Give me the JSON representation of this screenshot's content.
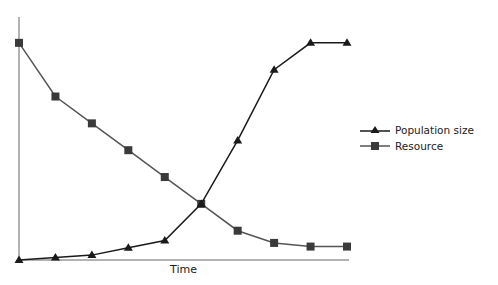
{
  "chart_data": {
    "type": "line",
    "title": "",
    "xlabel": "Time",
    "ylabel": "",
    "x": [
      0,
      1,
      2,
      3,
      4,
      5,
      6,
      7,
      8,
      9
    ],
    "series": [
      {
        "name": "Population size",
        "marker": "triangle",
        "values": [
          0,
          1,
          2,
          5,
          8,
          23,
          49,
          78,
          89,
          89
        ]
      },
      {
        "name": "Resource",
        "marker": "square",
        "values": [
          89,
          67,
          56,
          45,
          34,
          23,
          12,
          7,
          5.5,
          5.5
        ]
      }
    ],
    "ylim": [
      0,
      100
    ],
    "grid": false,
    "legend_position": "right",
    "colors": {
      "population": "#1a1a1a",
      "resource": "#555555",
      "resource_marker": "#3a3a3a",
      "axis": "#555555"
    }
  },
  "legend": {
    "population_label": "Population size",
    "resource_label": "Resource"
  }
}
